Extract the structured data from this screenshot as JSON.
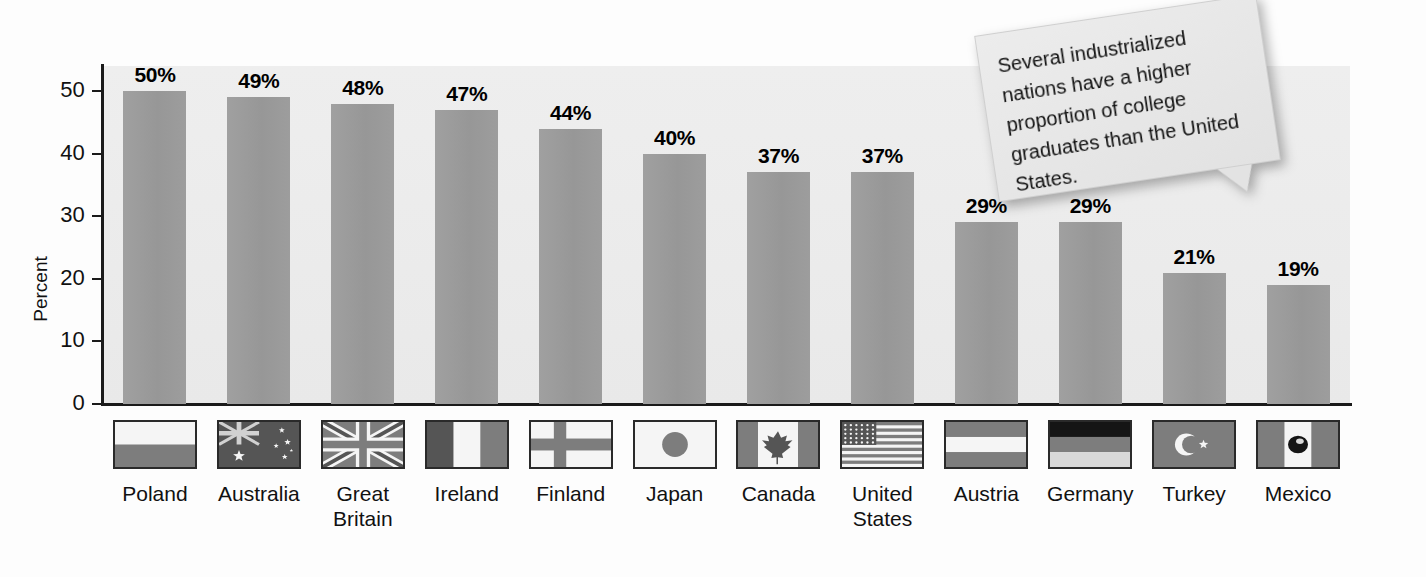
{
  "chart_data": {
    "type": "bar",
    "title": "",
    "xlabel": "",
    "ylabel": "Percent",
    "ylim": [
      0,
      54
    ],
    "yticks": [
      0,
      10,
      20,
      30,
      40,
      50
    ],
    "ytick_labels": [
      "0",
      "10",
      "20",
      "30",
      "40",
      "50"
    ],
    "grid": false,
    "legend": "none",
    "categories": [
      "Poland",
      "Australia",
      "Great Britain",
      "Ireland",
      "Finland",
      "Japan",
      "Canada",
      "United States",
      "Austria",
      "Germany",
      "Turkey",
      "Mexico"
    ],
    "values": [
      50,
      49,
      48,
      47,
      44,
      40,
      37,
      37,
      29,
      29,
      21,
      19
    ],
    "value_labels": [
      "50%",
      "49%",
      "48%",
      "47%",
      "44%",
      "40%",
      "37%",
      "37%",
      "29%",
      "29%",
      "21%",
      "19%"
    ],
    "bar_color": "#9b9b9b",
    "plot_background": "#ebebeb",
    "axis_color": "#1a1a1a"
  },
  "countries": [
    {
      "name_lines": [
        "Poland"
      ],
      "flag": "flag-poland",
      "value_label": "50%"
    },
    {
      "name_lines": [
        "Australia"
      ],
      "flag": "flag-australia",
      "value_label": "49%"
    },
    {
      "name_lines": [
        "Great",
        "Britain"
      ],
      "flag": "flag-great-britain",
      "value_label": "48%"
    },
    {
      "name_lines": [
        "Ireland"
      ],
      "flag": "flag-ireland",
      "value_label": "47%"
    },
    {
      "name_lines": [
        "Finland"
      ],
      "flag": "flag-finland",
      "value_label": "44%"
    },
    {
      "name_lines": [
        "Japan"
      ],
      "flag": "flag-japan",
      "value_label": "40%"
    },
    {
      "name_lines": [
        "Canada"
      ],
      "flag": "flag-canada",
      "value_label": "37%"
    },
    {
      "name_lines": [
        "United",
        "States"
      ],
      "flag": "flag-united-states",
      "value_label": "37%"
    },
    {
      "name_lines": [
        "Austria"
      ],
      "flag": "flag-austria",
      "value_label": "29%"
    },
    {
      "name_lines": [
        "Germany"
      ],
      "flag": "flag-germany",
      "value_label": "29%"
    },
    {
      "name_lines": [
        "Turkey"
      ],
      "flag": "flag-turkey",
      "value_label": "21%"
    },
    {
      "name_lines": [
        "Mexico"
      ],
      "flag": "flag-mexico",
      "value_label": "19%"
    }
  ],
  "callout": {
    "text": "Several industrialized nations have a higher proportion of college graduates than the United States."
  }
}
